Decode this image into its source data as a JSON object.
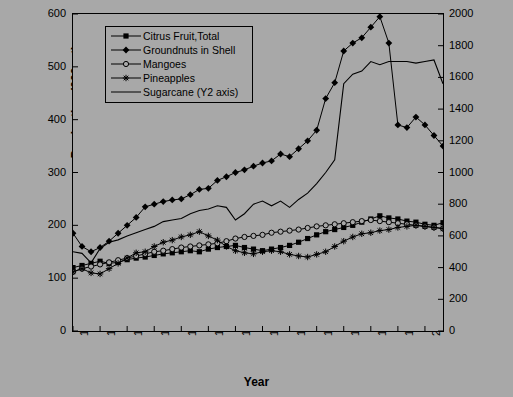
{
  "chart_data": {
    "type": "line",
    "title": "",
    "xlabel": "Year",
    "ylabel": "Production (000 mt)",
    "ylabel_right": "Production (000 mt)",
    "xlim": [
      1961,
      2002
    ],
    "ylim": [
      0,
      600
    ],
    "ylim_right": [
      0,
      2000
    ],
    "grid": false,
    "legend_position": "top-left inside plot",
    "yticks": [
      0,
      100,
      200,
      300,
      400,
      500,
      600
    ],
    "yticks_right": [
      0,
      200,
      400,
      600,
      800,
      1000,
      1200,
      1400,
      1600,
      1800,
      2000
    ],
    "xticks": [
      1961,
      1964,
      1967,
      1970,
      1973,
      1976,
      1979,
      1982,
      1985,
      1988,
      1991,
      1994,
      1997,
      2000
    ],
    "x": [
      1961,
      1962,
      1963,
      1964,
      1965,
      1966,
      1967,
      1968,
      1969,
      1970,
      1971,
      1972,
      1973,
      1974,
      1975,
      1976,
      1977,
      1978,
      1979,
      1980,
      1981,
      1982,
      1983,
      1984,
      1985,
      1986,
      1987,
      1988,
      1989,
      1990,
      1991,
      1992,
      1993,
      1994,
      1995,
      1996,
      1997,
      1998,
      1999,
      2000,
      2001,
      2002
    ],
    "series": [
      {
        "name": "Citrus Fruit,Total",
        "axis": "y1",
        "marker": "filled-square",
        "values": [
          120,
          124,
          128,
          132,
          128,
          130,
          135,
          138,
          140,
          143,
          146,
          148,
          150,
          152,
          150,
          155,
          158,
          160,
          162,
          158,
          155,
          152,
          155,
          158,
          162,
          168,
          175,
          182,
          188,
          192,
          196,
          200,
          206,
          212,
          218,
          214,
          212,
          208,
          206,
          202,
          200,
          205
        ]
      },
      {
        "name": "Groundnuts in Shell",
        "axis": "y1",
        "marker": "filled-diamond",
        "values": [
          185,
          160,
          150,
          158,
          170,
          185,
          200,
          215,
          235,
          240,
          245,
          248,
          250,
          258,
          268,
          270,
          285,
          292,
          300,
          305,
          312,
          318,
          322,
          335,
          330,
          345,
          360,
          380,
          440,
          470,
          530,
          545,
          555,
          575,
          595,
          545,
          390,
          385,
          405,
          390,
          370,
          350
        ]
      },
      {
        "name": "Mangoes",
        "axis": "y1",
        "marker": "open-circle",
        "values": [
          112,
          118,
          122,
          126,
          130,
          134,
          138,
          142,
          146,
          150,
          152,
          155,
          158,
          160,
          162,
          164,
          166,
          170,
          175,
          178,
          180,
          182,
          186,
          188,
          190,
          192,
          195,
          198,
          200,
          202,
          204,
          206,
          208,
          210,
          208,
          206,
          204,
          202,
          200,
          198,
          196,
          194
        ]
      },
      {
        "name": "Pineapples",
        "axis": "y1",
        "marker": "star-cross",
        "values": [
          112,
          118,
          110,
          108,
          118,
          128,
          138,
          148,
          150,
          160,
          168,
          172,
          178,
          182,
          188,
          180,
          172,
          160,
          152,
          148,
          146,
          150,
          152,
          150,
          145,
          142,
          140,
          145,
          150,
          160,
          170,
          178,
          184,
          186,
          190,
          192,
          196,
          198,
          200,
          198,
          196,
          194
        ]
      },
      {
        "name": "Sugarcane (Y2 axis)",
        "axis": "y2",
        "marker": "none",
        "values": [
          500,
          490,
          430,
          520,
          560,
          575,
          600,
          620,
          640,
          660,
          690,
          700,
          710,
          740,
          760,
          770,
          790,
          780,
          700,
          740,
          800,
          820,
          790,
          820,
          780,
          830,
          870,
          930,
          1000,
          1080,
          1560,
          1620,
          1640,
          1700,
          1680,
          1700,
          1700,
          1700,
          1690,
          1700,
          1710,
          1560
        ]
      }
    ]
  }
}
